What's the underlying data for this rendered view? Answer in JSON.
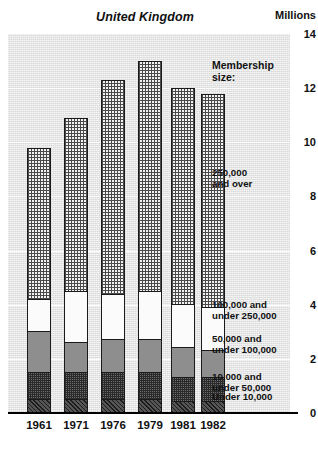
{
  "header": {
    "title": "United Kingdom",
    "unit": "Millions"
  },
  "legend": {
    "heading": "Membership\nsize:",
    "items": [
      {
        "key": "over250k",
        "label": "250,000\nand over"
      },
      {
        "key": "100to250k",
        "label": "100,000 and\nunder 250,000"
      },
      {
        "key": "50to100k",
        "label": "50,000 and\nunder 100,000"
      },
      {
        "key": "10to50k",
        "label": "10,000 and\nunder 50,000"
      },
      {
        "key": "under10k",
        "label": "Under 10,000"
      }
    ]
  },
  "axes": {
    "y_ticks": [
      "14",
      "12",
      "10",
      "8",
      "6",
      "4",
      "2",
      "0"
    ],
    "x_ticks": [
      "1961",
      "1971",
      "1976",
      "1979",
      "1981",
      "1982"
    ]
  },
  "chart_data": {
    "type": "bar",
    "stacked": true,
    "title": "United Kingdom",
    "xlabel": "",
    "ylabel": "Millions",
    "ylim": [
      0,
      14
    ],
    "ytick_step": 2,
    "grid": true,
    "legend_position": "right",
    "categories": [
      "1961",
      "1971",
      "1976",
      "1979",
      "1981",
      "1982"
    ],
    "series": [
      {
        "name": "Under 10,000",
        "values": [
          0.5,
          0.5,
          0.5,
          0.5,
          0.4,
          0.4
        ]
      },
      {
        "name": "10,000 and under 50,000",
        "values": [
          1.0,
          1.0,
          1.0,
          1.0,
          0.9,
          0.9
        ]
      },
      {
        "name": "50,000 and under 100,000",
        "values": [
          1.5,
          1.1,
          1.2,
          1.2,
          1.1,
          1.0
        ]
      },
      {
        "name": "100,000 and under 250,000",
        "values": [
          1.2,
          1.9,
          1.7,
          1.8,
          1.6,
          1.6
        ]
      },
      {
        "name": "250,000 and over",
        "values": [
          5.6,
          6.4,
          7.9,
          8.5,
          8.0,
          7.9
        ]
      }
    ],
    "totals": [
      9.8,
      10.9,
      12.3,
      13.0,
      12.0,
      11.8
    ],
    "bar_tops_label": [
      "9.8",
      "10.9",
      "12.3",
      "13.0",
      "12.0",
      "11.8"
    ]
  }
}
